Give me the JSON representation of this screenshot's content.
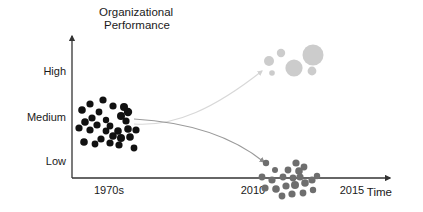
{
  "chart_data": {
    "type": "scatter",
    "title": "",
    "subtitle": "",
    "xlabel": "Time",
    "ylabel": "Organizational Performance",
    "ylabel_line1": "Organizational",
    "ylabel_line2": "Performance",
    "y_tick_labels": [
      "High",
      "Medium",
      "Low"
    ],
    "x_tick_labels": [
      "1970s",
      "2010",
      "2015"
    ],
    "ylim": [
      "Low",
      "High"
    ],
    "grid": false,
    "legend": null,
    "annotations": [
      {
        "name": "divergence-arrow-up",
        "label": "",
        "description": "light gray curved arrow from 1970s cluster rising to high-performance gray cluster",
        "color": "#dcdcdc"
      },
      {
        "name": "divergence-arrow-down",
        "label": "",
        "description": "gray curved arrow from 1970s cluster descending to low-performance gray cluster",
        "color": "#9a9a9a"
      }
    ],
    "series": [
      {
        "name": "1970s organizations",
        "color": "#111111",
        "marker": "circle",
        "points": [
          {
            "x": 103,
            "y": 100,
            "r": 3.6
          },
          {
            "x": 90,
            "y": 104,
            "r": 3.6
          },
          {
            "x": 113,
            "y": 106,
            "r": 3.6
          },
          {
            "x": 82,
            "y": 110,
            "r": 3.8
          },
          {
            "x": 99,
            "y": 112,
            "r": 3.4
          },
          {
            "x": 124,
            "y": 107,
            "r": 4.0
          },
          {
            "x": 128,
            "y": 112,
            "r": 4.2
          },
          {
            "x": 121,
            "y": 116,
            "r": 4.0
          },
          {
            "x": 92,
            "y": 118,
            "r": 3.6
          },
          {
            "x": 106,
            "y": 120,
            "r": 3.2
          },
          {
            "x": 85,
            "y": 122,
            "r": 3.8
          },
          {
            "x": 97,
            "y": 125,
            "r": 3.6
          },
          {
            "x": 110,
            "y": 126,
            "r": 3.4
          },
          {
            "x": 79,
            "y": 128,
            "r": 3.6
          },
          {
            "x": 90,
            "y": 130,
            "r": 3.6
          },
          {
            "x": 118,
            "y": 131,
            "r": 3.8
          },
          {
            "x": 128,
            "y": 129,
            "r": 3.8
          },
          {
            "x": 136,
            "y": 130,
            "r": 3.6
          },
          {
            "x": 113,
            "y": 136,
            "r": 3.8
          },
          {
            "x": 121,
            "y": 138,
            "r": 4.0
          },
          {
            "x": 130,
            "y": 137,
            "r": 3.8
          },
          {
            "x": 101,
            "y": 139,
            "r": 3.6
          },
          {
            "x": 84,
            "y": 142,
            "r": 3.8
          },
          {
            "x": 95,
            "y": 144,
            "r": 3.4
          },
          {
            "x": 110,
            "y": 143,
            "r": 3.6
          },
          {
            "x": 119,
            "y": 145,
            "r": 3.6
          },
          {
            "x": 134,
            "y": 148,
            "r": 3.4
          },
          {
            "x": 106,
            "y": 131,
            "r": 3.4
          },
          {
            "x": 126,
            "y": 121,
            "r": 3.6
          }
        ]
      },
      {
        "name": "2010s high performers",
        "color": "#cccccc",
        "marker": "circle",
        "points": [
          {
            "x": 269,
            "y": 61,
            "r": 5.0
          },
          {
            "x": 281,
            "y": 53,
            "r": 4.2
          },
          {
            "x": 272,
            "y": 73,
            "r": 2.8
          },
          {
            "x": 294,
            "y": 68,
            "r": 8.6
          },
          {
            "x": 313,
            "y": 55,
            "r": 10.5
          },
          {
            "x": 312,
            "y": 71,
            "r": 4.4
          }
        ]
      },
      {
        "name": "2010s low performers",
        "color": "#6e6e6e",
        "marker": "circle",
        "points": [
          {
            "x": 266,
            "y": 163,
            "r": 3.2
          },
          {
            "x": 262,
            "y": 177,
            "r": 3.4
          },
          {
            "x": 272,
            "y": 180,
            "r": 3.6
          },
          {
            "x": 283,
            "y": 177,
            "r": 3.4
          },
          {
            "x": 293,
            "y": 178,
            "r": 3.4
          },
          {
            "x": 288,
            "y": 170,
            "r": 3.4
          },
          {
            "x": 299,
            "y": 171,
            "r": 3.8
          },
          {
            "x": 296,
            "y": 163,
            "r": 3.6
          },
          {
            "x": 304,
            "y": 167,
            "r": 3.4
          },
          {
            "x": 265,
            "y": 188,
            "r": 3.6
          },
          {
            "x": 276,
            "y": 189,
            "r": 3.8
          },
          {
            "x": 286,
            "y": 186,
            "r": 3.6
          },
          {
            "x": 295,
            "y": 185,
            "r": 4.0
          },
          {
            "x": 305,
            "y": 183,
            "r": 3.8
          },
          {
            "x": 312,
            "y": 180,
            "r": 3.6
          },
          {
            "x": 317,
            "y": 176,
            "r": 3.2
          },
          {
            "x": 282,
            "y": 196,
            "r": 3.4
          },
          {
            "x": 292,
            "y": 194,
            "r": 3.6
          },
          {
            "x": 303,
            "y": 193,
            "r": 3.4
          },
          {
            "x": 313,
            "y": 190,
            "r": 3.2
          },
          {
            "x": 275,
            "y": 170,
            "r": 3.0
          },
          {
            "x": 300,
            "y": 177,
            "r": 3.6
          }
        ]
      }
    ],
    "axes": {
      "y_axis_color": "#333333",
      "x_axis_color": "#333333",
      "y_tick_positions": {
        "High": 71,
        "Medium": 117,
        "Low": 161
      },
      "x_tick_positions": {
        "1970s": 109,
        "2010": 253,
        "2015": 352
      }
    }
  }
}
